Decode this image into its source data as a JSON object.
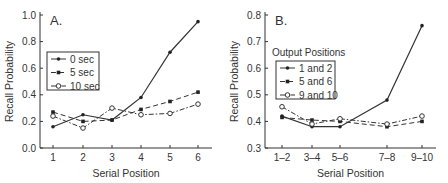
{
  "chart_data": [
    {
      "type": "line",
      "panel_label": "A.",
      "title": "",
      "xlabel": "Serial Position",
      "ylabel": "Recall Probability",
      "categories": [
        "1",
        "2",
        "3",
        "4",
        "5",
        "6"
      ],
      "yticks": [
        "0.0",
        "0.2",
        "0.4",
        "0.6",
        "0.8",
        "1.0"
      ],
      "ylim": [
        0,
        1.0
      ],
      "legend_title": "",
      "legend_position": "left-middle",
      "series": [
        {
          "name": "0 sec",
          "style": "solid",
          "marker": "filled-circle",
          "values": [
            0.16,
            0.25,
            0.21,
            0.38,
            0.72,
            0.95
          ]
        },
        {
          "name": "5 sec",
          "style": "dashed",
          "marker": "filled-square",
          "values": [
            0.27,
            0.2,
            0.21,
            0.29,
            0.35,
            0.42
          ]
        },
        {
          "name": "10 sec",
          "style": "dash-dot",
          "marker": "open-circle",
          "values": [
            0.24,
            0.15,
            0.3,
            0.25,
            0.26,
            0.33
          ]
        }
      ]
    },
    {
      "type": "line",
      "panel_label": "B.",
      "title": "",
      "xlabel": "Serial Position",
      "ylabel": "Recall Probability",
      "categories": [
        "1–2",
        "3–4",
        "5–6",
        "7–8",
        "9–10"
      ],
      "yticks": [
        "0.3",
        "0.4",
        "0.5",
        "0.6",
        "0.7",
        "0.8"
      ],
      "ylim": [
        0.3,
        0.8
      ],
      "legend_title": "Output Positions",
      "legend_position": "left-middle",
      "series": [
        {
          "name": "1 and 2",
          "style": "solid",
          "marker": "filled-circle",
          "values": [
            0.42,
            0.38,
            0.38,
            0.48,
            0.76
          ]
        },
        {
          "name": "5 and 6",
          "style": "dashed",
          "marker": "filled-square",
          "values": [
            0.415,
            0.405,
            0.4,
            0.38,
            0.4
          ]
        },
        {
          "name": "9 and 10",
          "style": "dash-dot",
          "marker": "open-circle",
          "values": [
            0.455,
            0.39,
            0.41,
            0.39,
            0.42
          ]
        }
      ]
    }
  ]
}
